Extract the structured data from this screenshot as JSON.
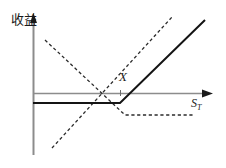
{
  "figure": {
    "title": "",
    "y_axis_label": "收益",
    "x_axis_label_symbol": "S",
    "x_axis_label_subscript": "T",
    "strike_label": "X",
    "colors": {
      "axis": "#8c8c8c",
      "solid_curve": "#141414",
      "dashed_curve": "#2b2b2b",
      "background": "#ffffff",
      "text": "#1a1a1a"
    }
  },
  "chart_data": {
    "type": "line",
    "title": "",
    "xlabel": "S_T",
    "ylabel": "收益",
    "grid": false,
    "legend": "none",
    "axes": {
      "origin_px": [
        33,
        93
      ],
      "x_axis_y_px": 93,
      "y_axis_x_px": 33,
      "x_axis_end_px": 212,
      "y_axis_top_px": 15,
      "y_axis_bottom_px": 155,
      "strike_x_px": 120,
      "xlim_px": [
        33,
        212
      ],
      "ylim_px": [
        15,
        155
      ]
    },
    "annotations": [
      {
        "text": "X",
        "x_px": 119,
        "y_px": 70,
        "style": "italic",
        "tick": true
      },
      {
        "text": "S_T",
        "x_px": 191,
        "y_px": 97,
        "style": "italic"
      },
      {
        "text": "收益",
        "x_px": 11,
        "y_px": 13,
        "style": "vertical"
      }
    ],
    "series": [
      {
        "name": "covered-call-payoff",
        "style": "solid",
        "color": "#141414",
        "width": 2.0,
        "points_px": [
          [
            33,
            103
          ],
          [
            120,
            103
          ],
          [
            205,
            20
          ]
        ],
        "description": "Flat negative payoff below strike X, rising linearly above X"
      },
      {
        "name": "long-underlying-payoff",
        "style": "dashed",
        "color": "#2b2b2b",
        "width": 1.3,
        "points_px": [
          [
            52,
            148
          ],
          [
            172,
            17
          ]
        ],
        "description": "Upward sloping dashed line through the strike region"
      },
      {
        "name": "short-call-payoff",
        "style": "dashed",
        "color": "#2b2b2b",
        "width": 1.3,
        "points_px": [
          [
            45,
            40
          ],
          [
            125,
            115
          ],
          [
            195,
            115
          ]
        ],
        "description": "Downward sloping dashed line flattening to a constant below the axis after X"
      }
    ]
  }
}
